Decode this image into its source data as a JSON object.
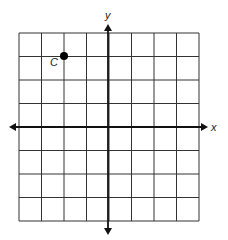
{
  "diagram": {
    "type": "coordinate-grid",
    "grid": {
      "cols": 8,
      "rows": 8,
      "x_min": -4,
      "x_max": 4,
      "y_min": -4,
      "y_max": 4
    },
    "axes": {
      "x_label": "x",
      "y_label": "y"
    },
    "points": [
      {
        "label": "C",
        "x": -2,
        "y": 3
      }
    ],
    "colors": {
      "grid": "#333333",
      "axis": "#111111",
      "point": "#000000"
    }
  },
  "chart_data": {
    "type": "scatter",
    "title": "",
    "xlabel": "x",
    "ylabel": "y",
    "xlim": [
      -4,
      4
    ],
    "ylim": [
      -4,
      4
    ],
    "grid": true,
    "series": [
      {
        "name": "C",
        "x": [
          -2
        ],
        "y": [
          3
        ]
      }
    ]
  }
}
